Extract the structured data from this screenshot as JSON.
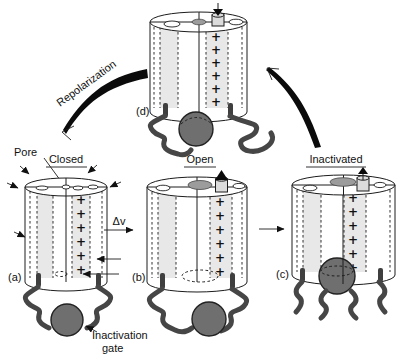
{
  "figure_labels": {
    "pore": "Pore",
    "repolarization": "Repolarization",
    "delta_v": "Δv",
    "inactivation_gate_line1": "Inactivation",
    "inactivation_gate_line2": "gate"
  },
  "panels": {
    "a": {
      "tag": "(a)",
      "state": "Closed"
    },
    "b": {
      "tag": "(b)",
      "state": "Open"
    },
    "c": {
      "tag": "(c)",
      "state": "Inactivated"
    },
    "d": {
      "tag": "(d)"
    }
  },
  "charge_symbol": "+",
  "charge_count_per_channel": 6,
  "colors": {
    "background": "#ffffff",
    "line": "#1c1c1c",
    "stripe_fill": "#e8e8e8",
    "ball_fill": "#6f6f6f",
    "pore_fill": "#9c9c9c",
    "plug_fill": "#dcdcdc",
    "squiggle": "#464646"
  }
}
